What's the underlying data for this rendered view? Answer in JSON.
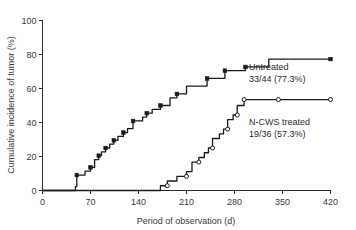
{
  "chart_data": {
    "type": "line",
    "title": "",
    "xlabel": "Period of observation (d)",
    "ylabel": "Cumulative incidence of tumor (%)",
    "xlim": [
      0,
      420
    ],
    "ylim": [
      0,
      100
    ],
    "xticks": [
      0,
      70,
      140,
      210,
      280,
      350,
      420
    ],
    "yticks": [
      0,
      20,
      40,
      60,
      80,
      100
    ],
    "xtick_labels": [
      "0",
      "70",
      "140",
      "210",
      "280",
      "350",
      "420"
    ],
    "ytick_labels": [
      "0",
      "20",
      "40",
      "60",
      "80",
      "100"
    ],
    "grid": false,
    "legend_position": "inline-annotation",
    "series": [
      {
        "name": "Untreated",
        "marker": "filled-square",
        "annotation_line1": "Untreated",
        "annotation_line2": "33/44 (77.3%)",
        "points": [
          [
            0,
            0
          ],
          [
            48,
            0
          ],
          [
            48,
            2.3
          ],
          [
            50,
            2.3
          ],
          [
            50,
            9.1
          ],
          [
            62,
            9.1
          ],
          [
            62,
            11.4
          ],
          [
            70,
            11.4
          ],
          [
            70,
            13.6
          ],
          [
            76,
            13.6
          ],
          [
            76,
            18.2
          ],
          [
            82,
            18.2
          ],
          [
            82,
            20.5
          ],
          [
            86,
            20.5
          ],
          [
            86,
            22.7
          ],
          [
            92,
            22.7
          ],
          [
            92,
            25.0
          ],
          [
            98,
            25.0
          ],
          [
            98,
            27.3
          ],
          [
            104,
            27.3
          ],
          [
            104,
            29.5
          ],
          [
            110,
            29.5
          ],
          [
            110,
            31.8
          ],
          [
            118,
            31.8
          ],
          [
            118,
            34.1
          ],
          [
            124,
            34.1
          ],
          [
            124,
            36.4
          ],
          [
            132,
            36.4
          ],
          [
            132,
            40.9
          ],
          [
            146,
            40.9
          ],
          [
            146,
            43.2
          ],
          [
            152,
            43.2
          ],
          [
            152,
            45.5
          ],
          [
            160,
            45.5
          ],
          [
            160,
            47.7
          ],
          [
            172,
            47.7
          ],
          [
            172,
            50.0
          ],
          [
            186,
            50.0
          ],
          [
            186,
            54.5
          ],
          [
            196,
            54.5
          ],
          [
            196,
            56.8
          ],
          [
            210,
            56.8
          ],
          [
            210,
            61.4
          ],
          [
            240,
            61.4
          ],
          [
            240,
            65.9
          ],
          [
            266,
            65.9
          ],
          [
            266,
            70.5
          ],
          [
            296,
            70.5
          ],
          [
            296,
            72.7
          ],
          [
            330,
            72.7
          ],
          [
            330,
            77.3
          ],
          [
            420,
            77.3
          ]
        ],
        "markers": [
          [
            50,
            9.1
          ],
          [
            70,
            13.6
          ],
          [
            82,
            20.5
          ],
          [
            92,
            25.0
          ],
          [
            104,
            29.5
          ],
          [
            118,
            34.1
          ],
          [
            132,
            40.9
          ],
          [
            152,
            45.5
          ],
          [
            172,
            50.0
          ],
          [
            196,
            56.8
          ],
          [
            240,
            65.9
          ],
          [
            266,
            70.5
          ],
          [
            296,
            72.7
          ],
          [
            420,
            77.3
          ]
        ],
        "final_value": 77.3,
        "count": "33/44"
      },
      {
        "name": "N-CWS treated",
        "marker": "open-circle",
        "annotation_line1": "N-CWS treated",
        "annotation_line2": "19/36 (57.3%)",
        "points": [
          [
            0,
            0
          ],
          [
            172,
            0
          ],
          [
            172,
            2.8
          ],
          [
            182,
            2.8
          ],
          [
            182,
            5.6
          ],
          [
            196,
            5.6
          ],
          [
            196,
            8.3
          ],
          [
            210,
            8.3
          ],
          [
            210,
            11.1
          ],
          [
            218,
            11.1
          ],
          [
            218,
            16.7
          ],
          [
            228,
            16.7
          ],
          [
            228,
            19.4
          ],
          [
            236,
            19.4
          ],
          [
            236,
            22.2
          ],
          [
            242,
            22.2
          ],
          [
            242,
            25.0
          ],
          [
            248,
            25.0
          ],
          [
            248,
            30.6
          ],
          [
            258,
            30.6
          ],
          [
            258,
            33.3
          ],
          [
            264,
            33.3
          ],
          [
            264,
            36.1
          ],
          [
            270,
            36.1
          ],
          [
            270,
            41.7
          ],
          [
            278,
            41.7
          ],
          [
            278,
            44.4
          ],
          [
            284,
            44.4
          ],
          [
            284,
            50.0
          ],
          [
            294,
            50.0
          ],
          [
            294,
            53.5
          ],
          [
            344,
            53.5
          ],
          [
            420,
            53.5
          ]
        ],
        "markers": [
          [
            182,
            2.8
          ],
          [
            210,
            8.3
          ],
          [
            228,
            16.7
          ],
          [
            248,
            25.0
          ],
          [
            270,
            36.1
          ],
          [
            284,
            44.4
          ],
          [
            294,
            53.5
          ],
          [
            344,
            53.5
          ],
          [
            420,
            53.5
          ]
        ],
        "final_value": 53.5,
        "count": "19/36"
      }
    ]
  },
  "annotations": {
    "untreated": {
      "line1": "Untreated",
      "line2": "33/44 (77.3%)"
    },
    "ncws": {
      "line1": "N-CWS treated",
      "line2": "19/36 (57.3%)"
    }
  },
  "axes": {
    "x_title": "Period of observation (d)",
    "y_title": "Cumulative incidence of tumor (%)"
  },
  "colors": {
    "line": "#1a1a1a",
    "axis": "#2b2b2b",
    "background": "#ffffff"
  }
}
